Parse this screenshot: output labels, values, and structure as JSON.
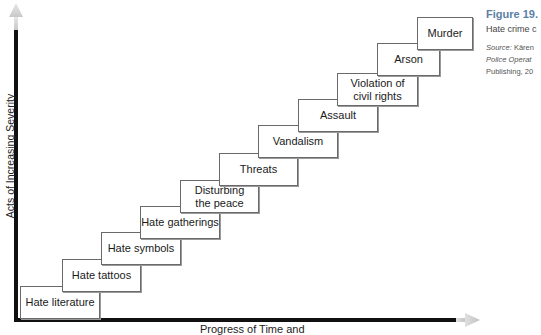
{
  "figure": {
    "number": "Figure 19.",
    "caption": "Hate crime c",
    "source_label": "Source:",
    "source_author": " Kären",
    "source_title": "Police Operat",
    "source_publisher": "Publishing, 20"
  },
  "axes": {
    "y_label": "Acts of Increasing Severity",
    "x_label": "Progress of Time and",
    "axis_color": "#111111",
    "arrow_color": "#b8b8b8"
  },
  "steps": [
    {
      "label": "Hate literature",
      "x": 20,
      "y": 286,
      "w": 80,
      "h": 33
    },
    {
      "label": "Hate tattoos",
      "x": 62,
      "y": 259,
      "w": 79,
      "h": 33
    },
    {
      "label": "Hate symbols",
      "x": 101,
      "y": 232,
      "w": 80,
      "h": 33
    },
    {
      "label": "Hate gatherings",
      "x": 140,
      "y": 206,
      "w": 80,
      "h": 33
    },
    {
      "label": "Disturbing\nthe peace",
      "x": 180,
      "y": 180,
      "w": 79,
      "h": 33
    },
    {
      "label": "Threats",
      "x": 219,
      "y": 153,
      "w": 79,
      "h": 33
    },
    {
      "label": "Vandalism",
      "x": 258,
      "y": 125,
      "w": 80,
      "h": 33
    },
    {
      "label": "Assault",
      "x": 298,
      "y": 99,
      "w": 80,
      "h": 33
    },
    {
      "label": "Violation of\ncivil rights",
      "x": 337,
      "y": 73,
      "w": 81,
      "h": 33
    },
    {
      "label": "Arson",
      "x": 377,
      "y": 43,
      "w": 63,
      "h": 33
    },
    {
      "label": "Murder",
      "x": 417,
      "y": 17,
      "w": 56,
      "h": 33
    }
  ]
}
